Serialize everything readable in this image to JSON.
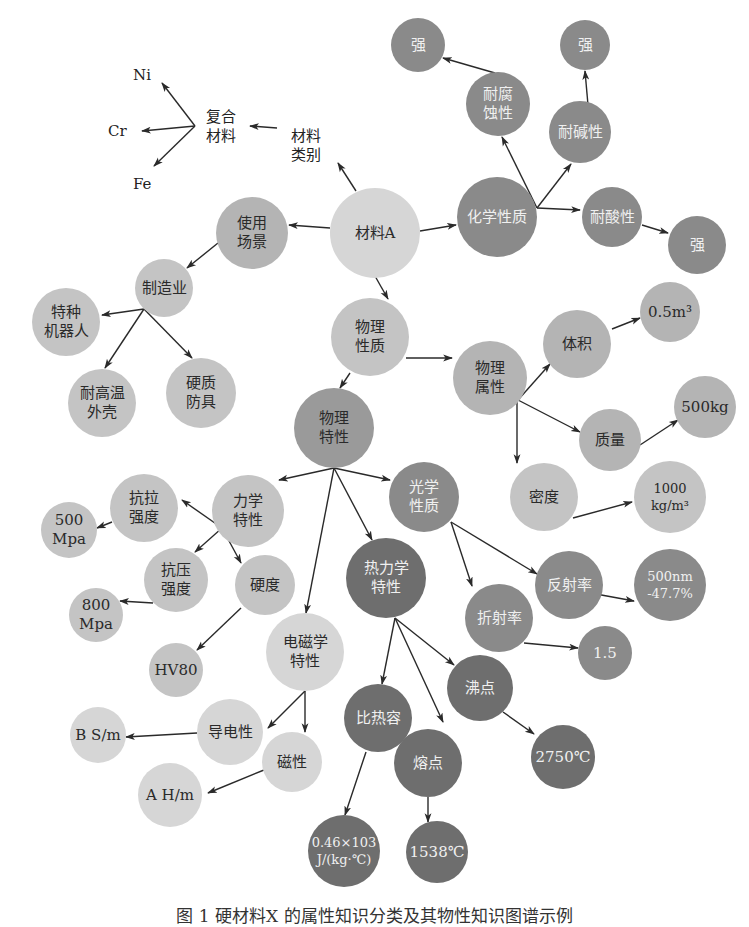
{
  "colors": {
    "lightest": "#d6d6d6",
    "light": "#c4c4c4",
    "medium": "#b4b4b4",
    "medium_dark": "#9a9a9a",
    "dark": "#8a8a8a",
    "darkest": "#6e6e6e",
    "edge": "#2a2a2a",
    "text_dark": "#2a2a2a",
    "text_light": "#f0f0f0"
  },
  "plain_labels": [
    {
      "id": "ni",
      "text": "Ni",
      "x": 133,
      "y": 66
    },
    {
      "id": "cr",
      "text": "Cr",
      "x": 108,
      "y": 122
    },
    {
      "id": "fe",
      "text": "Fe",
      "x": 133,
      "y": 175
    },
    {
      "id": "composite",
      "text": "复合\n材料",
      "x": 206,
      "y": 108
    },
    {
      "id": "material_class",
      "text": "材料\n类别",
      "x": 291,
      "y": 127
    }
  ],
  "nodes": [
    {
      "id": "material_a",
      "label": "材料A",
      "x": 375,
      "y": 233,
      "r": 45,
      "shade": "lightest"
    },
    {
      "id": "chemical",
      "label": "化学性质",
      "x": 497,
      "y": 217,
      "r": 40,
      "shade": "dark"
    },
    {
      "id": "corrosion",
      "label": "耐腐\n蚀性",
      "x": 498,
      "y": 104,
      "r": 32,
      "shade": "dark"
    },
    {
      "id": "strong1",
      "label": "强",
      "x": 418,
      "y": 45,
      "r": 27,
      "shade": "dark"
    },
    {
      "id": "alkali",
      "label": "耐碱性",
      "x": 580,
      "y": 132,
      "r": 31,
      "shade": "dark"
    },
    {
      "id": "strong2",
      "label": "强",
      "x": 585,
      "y": 45,
      "r": 25,
      "shade": "dark"
    },
    {
      "id": "acid",
      "label": "耐酸性",
      "x": 612,
      "y": 217,
      "r": 30,
      "shade": "dark"
    },
    {
      "id": "strong3",
      "label": "强",
      "x": 697,
      "y": 245,
      "r": 29,
      "shade": "dark"
    },
    {
      "id": "usage",
      "label": "使用\n场景",
      "x": 252,
      "y": 233,
      "r": 36,
      "shade": "medium"
    },
    {
      "id": "manufacturing",
      "label": "制造业",
      "x": 164,
      "y": 288,
      "r": 29,
      "shade": "light"
    },
    {
      "id": "robot",
      "label": "特种\n机器人",
      "x": 66,
      "y": 322,
      "r": 34,
      "shade": "light"
    },
    {
      "id": "heat_shell",
      "label": "耐高温\n外壳",
      "x": 102,
      "y": 403,
      "r": 34,
      "shade": "light"
    },
    {
      "id": "armor",
      "label": "硬质\n防具",
      "x": 201,
      "y": 393,
      "r": 35,
      "shade": "light"
    },
    {
      "id": "physical_nature",
      "label": "物理\n性质",
      "x": 370,
      "y": 337,
      "r": 39,
      "shade": "light"
    },
    {
      "id": "physical_attr",
      "label": "物理\n属性",
      "x": 490,
      "y": 378,
      "r": 37,
      "shade": "medium"
    },
    {
      "id": "volume",
      "label": "体积",
      "x": 577,
      "y": 344,
      "r": 34,
      "shade": "medium"
    },
    {
      "id": "volume_val",
      "label": "0.5m³",
      "x": 670,
      "y": 312,
      "r": 30,
      "shade": "medium"
    },
    {
      "id": "mass",
      "label": "质量",
      "x": 610,
      "y": 440,
      "r": 31,
      "shade": "medium"
    },
    {
      "id": "mass_val",
      "label": "500kg",
      "x": 705,
      "y": 407,
      "r": 31,
      "shade": "medium"
    },
    {
      "id": "density",
      "label": "密度",
      "x": 544,
      "y": 497,
      "r": 34,
      "shade": "light"
    },
    {
      "id": "density_val",
      "label": "1000\nkg/m³",
      "x": 670,
      "y": 497,
      "r": 36,
      "shade": "light"
    },
    {
      "id": "physical_prop",
      "label": "物理\n特性",
      "x": 334,
      "y": 428,
      "r": 40,
      "shade": "medium_dark"
    },
    {
      "id": "mechanical",
      "label": "力学\n特性",
      "x": 248,
      "y": 511,
      "r": 36,
      "shade": "light"
    },
    {
      "id": "optical",
      "label": "光学\n性质",
      "x": 424,
      "y": 497,
      "r": 35,
      "shade": "dark"
    },
    {
      "id": "tensile",
      "label": "抗拉\n强度",
      "x": 144,
      "y": 508,
      "r": 34,
      "shade": "light"
    },
    {
      "id": "tensile_val",
      "label": "500\nMpa",
      "x": 69,
      "y": 530,
      "r": 28,
      "shade": "light"
    },
    {
      "id": "compressive",
      "label": "抗压\n强度",
      "x": 176,
      "y": 580,
      "r": 32,
      "shade": "light"
    },
    {
      "id": "hardness",
      "label": "硬度",
      "x": 265,
      "y": 585,
      "r": 30,
      "shade": "light"
    },
    {
      "id": "compressive_val",
      "label": "800\nMpa",
      "x": 96,
      "y": 615,
      "r": 27,
      "shade": "light"
    },
    {
      "id": "hardness_val",
      "label": "HV80",
      "x": 176,
      "y": 670,
      "r": 27,
      "shade": "light"
    },
    {
      "id": "electromagnetic",
      "label": "电磁学\n特性",
      "x": 305,
      "y": 652,
      "r": 39,
      "shade": "lightest"
    },
    {
      "id": "thermodynamic",
      "label": "热力学\n特性",
      "x": 386,
      "y": 578,
      "r": 40,
      "shade": "darkest"
    },
    {
      "id": "reflectance",
      "label": "反射率",
      "x": 569,
      "y": 585,
      "r": 34,
      "shade": "dark"
    },
    {
      "id": "reflectance_val",
      "label": "500nm\n-47.7%",
      "x": 670,
      "y": 585,
      "r": 36,
      "shade": "dark"
    },
    {
      "id": "refraction",
      "label": "折射率",
      "x": 499,
      "y": 618,
      "r": 34,
      "shade": "dark"
    },
    {
      "id": "refraction_val",
      "label": "1.5",
      "x": 605,
      "y": 653,
      "r": 27,
      "shade": "dark"
    },
    {
      "id": "boiling",
      "label": "沸点",
      "x": 480,
      "y": 688,
      "r": 33,
      "shade": "darkest"
    },
    {
      "id": "specific_heat",
      "label": "比热容",
      "x": 378,
      "y": 718,
      "r": 34,
      "shade": "darkest"
    },
    {
      "id": "melting",
      "label": "熔点",
      "x": 428,
      "y": 763,
      "r": 34,
      "shade": "darkest"
    },
    {
      "id": "boiling_val",
      "label": "2750℃",
      "x": 563,
      "y": 757,
      "r": 32,
      "shade": "darkest"
    },
    {
      "id": "conductivity",
      "label": "导电性",
      "x": 230,
      "y": 732,
      "r": 33,
      "shade": "lightest"
    },
    {
      "id": "magnetism",
      "label": "磁性",
      "x": 292,
      "y": 762,
      "r": 30,
      "shade": "lightest"
    },
    {
      "id": "conductivity_val",
      "label": "B S/m",
      "x": 98,
      "y": 735,
      "r": 28,
      "shade": "lightest"
    },
    {
      "id": "magnetism_val",
      "label": "A H/m",
      "x": 170,
      "y": 795,
      "r": 32,
      "shade": "lightest"
    },
    {
      "id": "specific_heat_val",
      "label": "0.46×103\nJ/(kg·℃)",
      "x": 344,
      "y": 851,
      "r": 36,
      "shade": "darkest"
    },
    {
      "id": "melting_val",
      "label": "1538℃",
      "x": 437,
      "y": 852,
      "r": 31,
      "shade": "darkest"
    }
  ],
  "edges": [
    {
      "from": [
        356,
        191
      ],
      "to": [
        338,
        163
      ]
    },
    {
      "from": [
        277,
        128
      ],
      "to": [
        250,
        126
      ]
    },
    {
      "from": [
        195,
        126
      ],
      "to": [
        162,
        83
      ]
    },
    {
      "from": [
        195,
        126
      ],
      "to": [
        142,
        131
      ]
    },
    {
      "from": [
        195,
        126
      ],
      "to": [
        154,
        166
      ]
    },
    {
      "from": [
        330,
        228
      ],
      "to": [
        289,
        225
      ]
    },
    {
      "from": [
        218,
        243
      ],
      "to": [
        187,
        268
      ]
    },
    {
      "from": [
        144,
        309
      ],
      "to": [
        102,
        315
      ]
    },
    {
      "from": [
        144,
        309
      ],
      "to": [
        105,
        368
      ]
    },
    {
      "from": [
        144,
        309
      ],
      "to": [
        192,
        358
      ]
    },
    {
      "from": [
        420,
        231
      ],
      "to": [
        456,
        225
      ]
    },
    {
      "from": [
        537,
        208
      ],
      "to": [
        502,
        137
      ]
    },
    {
      "from": [
        537,
        208
      ],
      "to": [
        571,
        164
      ]
    },
    {
      "from": [
        537,
        208
      ],
      "to": [
        580,
        210
      ]
    },
    {
      "from": [
        495,
        73
      ],
      "to": [
        443,
        58
      ]
    },
    {
      "from": [
        588,
        105
      ],
      "to": [
        585,
        71
      ]
    },
    {
      "from": [
        642,
        225
      ],
      "to": [
        668,
        233
      ]
    },
    {
      "from": [
        375,
        276
      ],
      "to": [
        388,
        299
      ]
    },
    {
      "from": [
        406,
        358
      ],
      "to": [
        452,
        358
      ]
    },
    {
      "from": [
        350,
        373
      ],
      "to": [
        340,
        388
      ]
    },
    {
      "from": [
        518,
        400
      ],
      "to": [
        550,
        364
      ]
    },
    {
      "from": [
        518,
        400
      ],
      "to": [
        580,
        432
      ]
    },
    {
      "from": [
        517,
        400
      ],
      "to": [
        517,
        463
      ]
    },
    {
      "from": [
        612,
        329
      ],
      "to": [
        640,
        318
      ]
    },
    {
      "from": [
        640,
        445
      ],
      "to": [
        678,
        420
      ]
    },
    {
      "from": [
        573,
        518
      ],
      "to": [
        632,
        502
      ]
    },
    {
      "from": [
        334,
        468
      ],
      "to": [
        279,
        480
      ]
    },
    {
      "from": [
        334,
        468
      ],
      "to": [
        390,
        480
      ]
    },
    {
      "from": [
        334,
        468
      ],
      "to": [
        306,
        613
      ]
    },
    {
      "from": [
        334,
        468
      ],
      "to": [
        372,
        540
      ]
    },
    {
      "from": [
        222,
        528
      ],
      "to": [
        182,
        500
      ]
    },
    {
      "from": [
        222,
        528
      ],
      "to": [
        195,
        552
      ]
    },
    {
      "from": [
        222,
        528
      ],
      "to": [
        241,
        563
      ]
    },
    {
      "from": [
        112,
        522
      ],
      "to": [
        97,
        528
      ]
    },
    {
      "from": [
        153,
        603
      ],
      "to": [
        120,
        601
      ]
    },
    {
      "from": [
        241,
        608
      ],
      "to": [
        197,
        650
      ]
    },
    {
      "from": [
        451,
        522
      ],
      "to": [
        472,
        586
      ]
    },
    {
      "from": [
        451,
        522
      ],
      "to": [
        537,
        574
      ]
    },
    {
      "from": [
        596,
        594
      ],
      "to": [
        634,
        601
      ]
    },
    {
      "from": [
        524,
        643
      ],
      "to": [
        578,
        648
      ]
    },
    {
      "from": [
        395,
        618
      ],
      "to": [
        382,
        684
      ]
    },
    {
      "from": [
        395,
        618
      ],
      "to": [
        443,
        722
      ]
    },
    {
      "from": [
        395,
        618
      ],
      "to": [
        454,
        665
      ]
    },
    {
      "from": [
        503,
        712
      ],
      "to": [
        534,
        734
      ]
    },
    {
      "from": [
        366,
        752
      ],
      "to": [
        345,
        815
      ]
    },
    {
      "from": [
        428,
        797
      ],
      "to": [
        428,
        822
      ]
    },
    {
      "from": [
        305,
        691
      ],
      "to": [
        268,
        728
      ]
    },
    {
      "from": [
        305,
        691
      ],
      "to": [
        305,
        732
      ]
    },
    {
      "from": [
        197,
        733
      ],
      "to": [
        126,
        737
      ]
    },
    {
      "from": [
        264,
        770
      ],
      "to": [
        208,
        793
      ]
    }
  ],
  "caption": "图 1  硬材料X 的属性知识分类及其物性知识图谱示例"
}
